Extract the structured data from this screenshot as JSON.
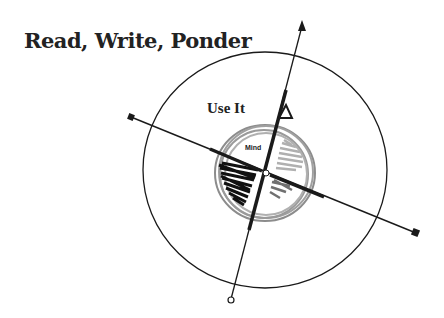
{
  "title": "Read, Write, Ponder",
  "labels": {
    "outer": "Use It",
    "inner": "Mind"
  },
  "colors": {
    "ink": "#1a1a1a",
    "inner_ring": "#8c8c8c",
    "shade_dark": "#111111",
    "shade_light": "#b0b0b0",
    "shade_mid": "#707070"
  }
}
